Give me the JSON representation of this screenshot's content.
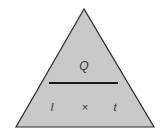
{
  "diagram": {
    "type": "formula-triangle",
    "top": "Q",
    "bottom_left": "I",
    "operator": "×",
    "bottom_right": "t",
    "colors": {
      "fill": "#c8c8c8",
      "stroke": "#2a2a2a",
      "text": "#333333",
      "background": "#ffffff"
    }
  }
}
